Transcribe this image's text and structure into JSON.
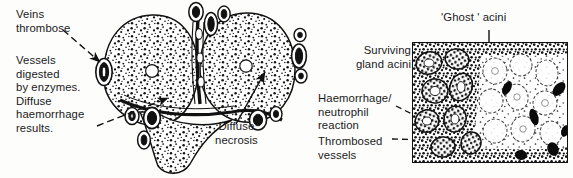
{
  "figure": {
    "domain_note": "black-and-white medical textbook line illustration of acute pancreatitis",
    "background_color": "#fdfdfc",
    "ink_color": "#111111"
  },
  "labels": {
    "veins_thrombose": "Veins\nthrombose",
    "vessels_digested": "Vessels\ndigested\nby enzymes.\nDiffuse\nhaemorrhage\nresults.",
    "diffuse_necrosis": "Diffuse\nnecrosis",
    "ghost_acini": "'Ghost ' acini",
    "surviving_gland_acini": "Surviving\ngland acini",
    "haemorrhage_neutrophil": "Haemorrhage/\nneutrophil\nreaction",
    "thrombosed_vessels": "Thrombosed\nvessels"
  },
  "organ_drawing": {
    "name": "pancreas-gross-specimen",
    "lobes": [
      "left-lobe",
      "right-lobe",
      "inferior-tail"
    ],
    "features": [
      "stippled-haemorrhagic-parenchyma",
      "white-duct-lumen",
      "peripheral-thrombosed-vessels"
    ]
  },
  "histology_panel": {
    "name": "histology-micrograph",
    "regions": [
      "surviving-dark-acini-left",
      "pale-ghost-acini-right",
      "black-thrombosed-vessels"
    ]
  },
  "leaders": {
    "veins_thrombose": "dashed-arrow",
    "vessels_digested": "dashed-arrow",
    "diffuse_necrosis": "solid-arrow",
    "ghost_acini": "solid-arrow",
    "surviving_gland_acini": "dashed-arrow",
    "haemorrhage_neutrophil": "dashed-arrow",
    "thrombosed_vessels": "dashed-line"
  }
}
